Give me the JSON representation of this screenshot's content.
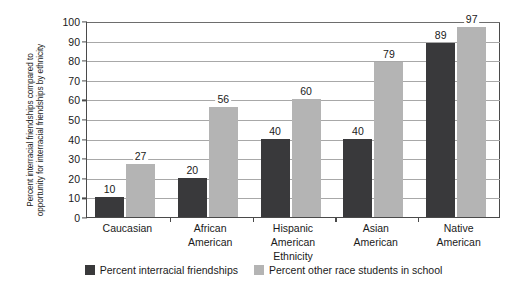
{
  "chart_data": {
    "type": "bar",
    "title": "",
    "xlabel": "",
    "ylabel_lines": [
      "Percent interracial friendships compared to",
      "opportunity for interracial friendships by ethnicity"
    ],
    "ylabel": "Percent interracial friendships compared to opportunity for interracial friendships by ethnicity",
    "categories": [
      "Caucasian",
      "African American",
      "Hispanic American Ethnicity",
      "Asian American",
      "Native American"
    ],
    "category_label_lines": [
      [
        "Caucasian"
      ],
      [
        "African",
        "American"
      ],
      [
        "Hispanic",
        "American",
        "Ethnicity"
      ],
      [
        "Asian",
        "American"
      ],
      [
        "Native",
        "American"
      ]
    ],
    "series": [
      {
        "name": "Percent interracial friendships",
        "color": "#39393b",
        "values": [
          10,
          20,
          40,
          40,
          89
        ]
      },
      {
        "name": "Percent other race students in school",
        "color": "#b4b4b4",
        "values": [
          27,
          56,
          60,
          79,
          97
        ]
      }
    ],
    "ylim": [
      0,
      100
    ],
    "ytick_values": [
      0,
      10,
      20,
      30,
      40,
      50,
      60,
      70,
      80,
      90,
      100
    ],
    "ytick_labels": [
      "0",
      "10",
      "20",
      "30",
      "40",
      "50",
      "60",
      "70",
      "80",
      "90",
      "100"
    ],
    "grid": "horizontal",
    "legend_position": "bottom-center"
  },
  "legend": {
    "items": [
      {
        "label": "Percent interracial friendships",
        "swatch": "dark"
      },
      {
        "label": "Percent other race students in school",
        "swatch": "light"
      }
    ]
  },
  "colors": {
    "series_dark": "#39393b",
    "series_light": "#b4b4b4",
    "axis": "#4a4a4a",
    "gridline": "#a8a8a8",
    "background": "#ffffff"
  }
}
